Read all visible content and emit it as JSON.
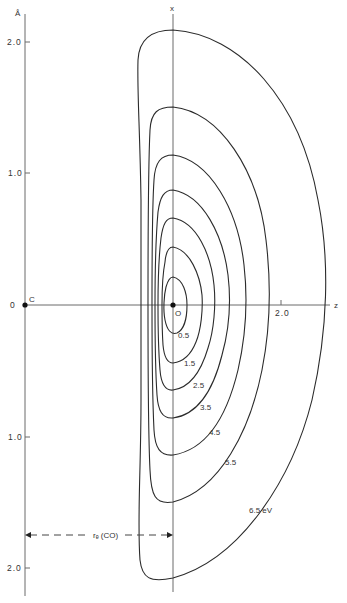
{
  "figure": {
    "unit_label": "Å",
    "y_axis_ticks": [
      {
        "label": "2.0",
        "y": 42
      },
      {
        "label": "1.0",
        "y": 173
      },
      {
        "label": "0",
        "y": 305
      },
      {
        "label": "1.0",
        "y": 437
      },
      {
        "label": "2.0",
        "y": 568
      }
    ],
    "z_axis": {
      "label": "z",
      "tick_label": "2.0"
    },
    "x_axis": {
      "label": "x"
    },
    "points": {
      "carbon": {
        "label": "C"
      },
      "oxygen": {
        "label": "O"
      }
    },
    "distance_annotation": {
      "label": "rₑ (CO)"
    },
    "contours": [
      {
        "level": "0.5",
        "label": "0.5"
      },
      {
        "level": "1.5",
        "label": "1.5"
      },
      {
        "level": "2.5",
        "label": "2.5"
      },
      {
        "level": "3.5",
        "label": "3.5"
      },
      {
        "level": "4.5",
        "label": "4.5"
      },
      {
        "level": "5.5",
        "label": "5.5"
      },
      {
        "level": "6.5",
        "label": "6.5 eV"
      }
    ]
  }
}
